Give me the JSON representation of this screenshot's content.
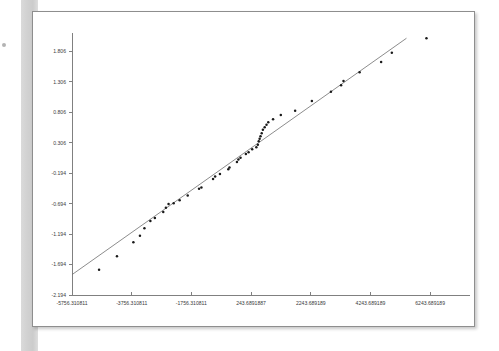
{
  "figure": {
    "background_color": "#ffffff",
    "card_border_color": "#8e8e8e",
    "point_color": "#1a1a1a",
    "line_color": "#6f6f6f",
    "axis_color": "#808080"
  },
  "chart_data": {
    "type": "scatter",
    "title": "",
    "subtitle": "",
    "xlabel": "",
    "ylabel": "",
    "grid": false,
    "legend": false,
    "xlim": [
      -5756.310811,
      7243.689189
    ],
    "ylim": [
      -2.194,
      2.106
    ],
    "xticks": [
      -5756.310811,
      -3756.310811,
      -1756.310811,
      243.6891887,
      2243.689189,
      4243.689189,
      6243.689189
    ],
    "xticklabels": [
      "-5756.310811",
      "-3756.310811",
      "-1756.310811",
      "243.6891887",
      "2243.689189",
      "4243.689189",
      "6243.689189"
    ],
    "yticks": [
      1.806,
      1.306,
      0.806,
      0.306,
      -0.194,
      -0.694,
      -1.194,
      -1.694,
      -2.194
    ],
    "yticklabels": [
      "1.806",
      "1.306",
      "0.806",
      "0.306",
      "-0.194",
      "-0.694",
      "-1.194",
      "-1.694",
      "-2.194"
    ],
    "series": [
      {
        "name": "observations",
        "marker": "dot",
        "points": [
          [
            -4850,
            -1.78
          ],
          [
            -4250,
            -1.56
          ],
          [
            -3700,
            -1.33
          ],
          [
            -3480,
            -1.22
          ],
          [
            -3330,
            -1.1
          ],
          [
            -3130,
            -0.98
          ],
          [
            -2980,
            -0.93
          ],
          [
            -2700,
            -0.83
          ],
          [
            -2610,
            -0.76
          ],
          [
            -2520,
            -0.7
          ],
          [
            -2350,
            -0.69
          ],
          [
            -2150,
            -0.64
          ],
          [
            -1880,
            -0.56
          ],
          [
            -1500,
            -0.45
          ],
          [
            -1420,
            -0.43
          ],
          [
            -1030,
            -0.29
          ],
          [
            -960,
            -0.25
          ],
          [
            -800,
            -0.21
          ],
          [
            -520,
            -0.13
          ],
          [
            -480,
            -0.1
          ],
          [
            -230,
            -0.01
          ],
          [
            -180,
            0.03
          ],
          [
            -110,
            0.06
          ],
          [
            70,
            0.12
          ],
          [
            160,
            0.15
          ],
          [
            280,
            0.2
          ],
          [
            420,
            0.23
          ],
          [
            470,
            0.27
          ],
          [
            500,
            0.33
          ],
          [
            530,
            0.37
          ],
          [
            560,
            0.41
          ],
          [
            600,
            0.46
          ],
          [
            640,
            0.52
          ],
          [
            700,
            0.56
          ],
          [
            760,
            0.6
          ],
          [
            820,
            0.64
          ],
          [
            980,
            0.69
          ],
          [
            1240,
            0.76
          ],
          [
            1720,
            0.83
          ],
          [
            2280,
            0.99
          ],
          [
            2920,
            1.14
          ],
          [
            3260,
            1.25
          ],
          [
            3340,
            1.32
          ],
          [
            3880,
            1.46
          ],
          [
            4600,
            1.63
          ],
          [
            4960,
            1.78
          ],
          [
            6120,
            2.02
          ]
        ]
      },
      {
        "name": "fit-line",
        "marker": "line",
        "endpoints": [
          [
            -5756.310811,
            -1.86
          ],
          [
            5450,
            2.02
          ]
        ]
      }
    ]
  }
}
